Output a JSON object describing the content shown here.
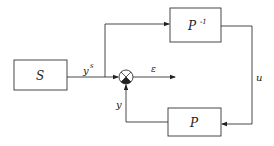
{
  "diagram": {
    "type": "block-diagram",
    "blocks": [
      {
        "id": "S",
        "label": "S"
      },
      {
        "id": "Pinv",
        "label": "P",
        "superscript": "-1"
      },
      {
        "id": "P",
        "label": "P"
      }
    ],
    "junctions": [
      {
        "id": "sum",
        "kind": "summing-junction"
      }
    ],
    "signals": {
      "ys": {
        "label": "y",
        "superscript": "s"
      },
      "epsilon": {
        "label": "ε"
      },
      "u": {
        "label": "u"
      },
      "y": {
        "label": "y"
      }
    },
    "edges": [
      {
        "from": "S",
        "to": "sum",
        "signal": "ys"
      },
      {
        "from": "S",
        "to": "Pinv",
        "signal": "ys"
      },
      {
        "from": "sum",
        "to": "output",
        "signal": "epsilon"
      },
      {
        "from": "Pinv",
        "to": "P",
        "signal": "u"
      },
      {
        "from": "P",
        "to": "sum",
        "signal": "y"
      }
    ],
    "colors": {
      "stroke": "#222222",
      "background": "#ffffff"
    }
  }
}
